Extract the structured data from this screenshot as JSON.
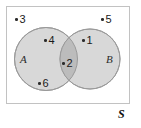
{
  "diagram": {
    "type": "venn-two-set",
    "title": "",
    "universal_set_label": "S",
    "sets": [
      {
        "id": "A",
        "label": "A"
      },
      {
        "id": "B",
        "label": "B"
      }
    ],
    "regions": {
      "A_only": [
        "4",
        "6"
      ],
      "B_only": [
        "1"
      ],
      "intersection": [
        "2"
      ],
      "outside": [
        "3",
        "5"
      ]
    },
    "elements": [
      {
        "value": "3",
        "region": "outside"
      },
      {
        "value": "5",
        "region": "outside"
      },
      {
        "value": "4",
        "region": "A_only"
      },
      {
        "value": "1",
        "region": "B_only"
      },
      {
        "value": "2",
        "region": "intersection"
      },
      {
        "value": "6",
        "region": "A_only"
      }
    ],
    "colors": {
      "circle_fill": "#d8d8d8",
      "intersection_fill": "#bcbcbc",
      "circle_stroke": "#9a9a9a",
      "rect_stroke": "#c2c2c2",
      "background": "#ffffff",
      "text": "#1a1a1a"
    }
  }
}
